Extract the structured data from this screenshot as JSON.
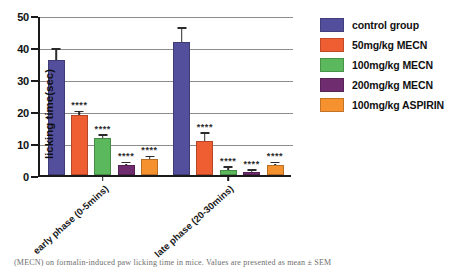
{
  "chart_data": {
    "type": "bar",
    "title": "",
    "xlabel": "",
    "ylabel": "licking time(sec)",
    "ylim": [
      0,
      50
    ],
    "yticks": [
      0,
      10,
      20,
      30,
      40,
      50
    ],
    "grid": true,
    "legend_position": "right",
    "categories": [
      "early phase (0-5mins)",
      "late phase (20-30mins)"
    ],
    "series": [
      {
        "name": "control group",
        "color": "#544f9c",
        "values": [
          36.0,
          41.5
        ],
        "errors": [
          3.2,
          4.2
        ],
        "significance": [
          "",
          ""
        ]
      },
      {
        "name": "50mg/kg MECN",
        "color": "#ef5e32",
        "values": [
          18.7,
          10.5
        ],
        "errors": [
          0.9,
          2.3
        ],
        "significance": [
          "****",
          "****"
        ]
      },
      {
        "name": "100mg/kg MECN",
        "color": "#5cb85c",
        "values": [
          11.5,
          1.7
        ],
        "errors": [
          0.8,
          0.5
        ],
        "significance": [
          "****",
          "****"
        ]
      },
      {
        "name": "200mg/kg MECN",
        "color": "#6f2d6f",
        "values": [
          3.2,
          1.0
        ],
        "errors": [
          0.4,
          0.3
        ],
        "significance": [
          "****",
          "****"
        ]
      },
      {
        "name": "100mg/kg ASPIRIN",
        "color": "#f5922f",
        "values": [
          5.1,
          3.2
        ],
        "errors": [
          0.4,
          0.4
        ],
        "significance": [
          "****",
          "****"
        ]
      }
    ]
  },
  "legend": {
    "items": [
      {
        "label": "control group",
        "color": "#544f9c"
      },
      {
        "label": "50mg/kg MECN",
        "color": "#ef5e32"
      },
      {
        "label": "100mg/kg MECN",
        "color": "#5cb85c"
      },
      {
        "label": "200mg/kg MECN",
        "color": "#6f2d6f"
      },
      {
        "label": "100mg/kg ASPIRIN",
        "color": "#f5922f"
      }
    ]
  },
  "caption": {
    "text": "(MECN) on formalin-induced paw licking time in mice. Values are presented as mean ± SEM"
  }
}
